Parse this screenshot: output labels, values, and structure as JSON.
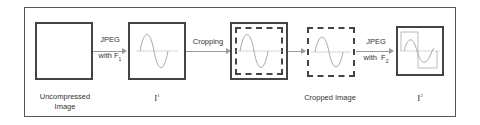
{
  "diagram": {
    "nodes": [
      {
        "id": "uncompressed",
        "label_line1": "Uncompressed",
        "label_line2": "Image"
      },
      {
        "id": "i1",
        "label": "I",
        "superscript": "1"
      },
      {
        "id": "cropped_dashed_in_i1",
        "label": ""
      },
      {
        "id": "cropped",
        "label": "Cropped Image"
      },
      {
        "id": "i2",
        "label": "I",
        "superscript": "2"
      }
    ],
    "edges": [
      {
        "from": "uncompressed",
        "to": "i1",
        "label_line1": "JPEG",
        "label_line2_prefix": "with F",
        "label_line2_sub": "1"
      },
      {
        "from": "i1",
        "to": "cropped_dashed_in_i1",
        "label": "Cropping"
      },
      {
        "from": "cropped_dashed_in_i1",
        "to": "cropped",
        "label": ""
      },
      {
        "from": "cropped",
        "to": "i2",
        "label_line1": "JPEG",
        "label_line2_prefix": "with  F",
        "label_line2_sub": "2"
      }
    ]
  }
}
